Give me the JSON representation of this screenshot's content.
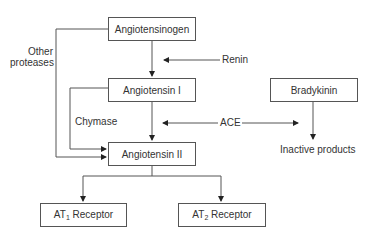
{
  "diagram": {
    "nodes": {
      "angiotensinogen": "Angiotensinogen",
      "angiotensin_i": "Angiotensin I",
      "angiotensin_ii": "Angiotensin II",
      "bradykinin": "Bradykinin",
      "inactive_products": "Inactive products",
      "at1_prefix": "AT",
      "at1_sub": "1",
      "at1_suffix": " Receptor",
      "at2_prefix": "AT",
      "at2_sub": "2",
      "at2_suffix": " Receptor"
    },
    "edge_labels": {
      "renin": "Renin",
      "ace": "ACE",
      "chymase": "Chymase",
      "other_proteases_line1": "Other",
      "other_proteases_line2": "proteases"
    },
    "edges": [
      {
        "from": "Angiotensinogen",
        "to": "Angiotensin I",
        "label": "Renin"
      },
      {
        "from": "Angiotensin I",
        "to": "Angiotensin II",
        "label": "ACE"
      },
      {
        "from": "Bradykinin",
        "to": "Inactive products",
        "label": "ACE"
      },
      {
        "from": "Angiotensin I",
        "to": "Angiotensin II",
        "label": "Chymase"
      },
      {
        "from": "Angiotensinogen",
        "to": "Angiotensin II",
        "label": "Other proteases"
      },
      {
        "from": "Angiotensin II",
        "to": "AT1 Receptor"
      },
      {
        "from": "Angiotensin II",
        "to": "AT2 Receptor"
      }
    ],
    "line_color": "#555555",
    "text_color": "#333333"
  }
}
